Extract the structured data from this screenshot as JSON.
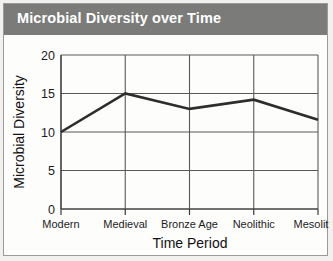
{
  "header": {
    "title": "Microbial Diversity over Time"
  },
  "colors": {
    "title_band": "#7b7b79",
    "title_text": "#ffffff",
    "line": "#2d2d2d",
    "grid": "#5a5a5a",
    "axis": "#3b3b3b",
    "panel": "#fdfdfc",
    "page_background": "#f2f1ef"
  },
  "chart_data": {
    "type": "line",
    "title": "Microbial Diversity over Time",
    "xlabel": "Time Period",
    "ylabel": "Microbial Diversity",
    "categories": [
      "Modern",
      "Medieval",
      "Bronze Age",
      "Neolithic",
      "Mesolithic"
    ],
    "values": [
      10,
      15,
      13,
      14.2,
      11.6
    ],
    "series": [
      {
        "name": "Microbial Diversity",
        "values": [
          10,
          15,
          13,
          14.2,
          11.6
        ]
      }
    ],
    "ylim": [
      0,
      20
    ],
    "yticks": [
      0,
      5,
      10,
      15,
      20
    ],
    "ytick_labels": [
      "0",
      "5",
      "10",
      "15",
      "20"
    ],
    "grid": true,
    "legend": false,
    "legend_position": "none",
    "markers": false
  }
}
